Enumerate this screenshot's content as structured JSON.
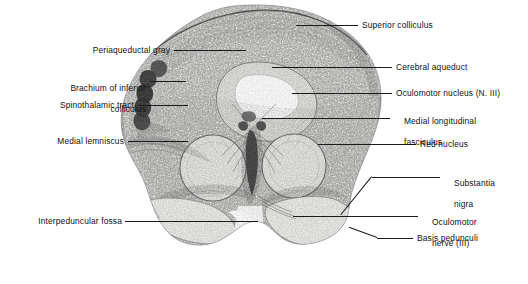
{
  "figure": {
    "background_color": "#ffffff",
    "label_color": "#111111",
    "leader_color": "#1a1a1a",
    "specimen": {
      "stain_description": "Weigert-stained myelin histological section, grayscale",
      "tissue_tone": "#f2f2f0",
      "fiber_tone": "#5a5a5a",
      "dark_tone": "#2b2b2b"
    }
  },
  "labels": {
    "superior_colliculus": {
      "text": "Superior colliculus",
      "side": "right"
    },
    "periaqueductal_gray": {
      "text": "Periaqueductal gray",
      "side": "left"
    },
    "cerebral_aqueduct": {
      "text": "Cerebral aqueduct",
      "side": "right"
    },
    "brachium_of_inferior_colliculus": {
      "line1": "Brachium of inferior",
      "line2": "colliculus",
      "side": "left"
    },
    "oculomotor_nucleus": {
      "text": "Oculomotor nucleus (N. III)",
      "side": "right"
    },
    "spinothalamic_tract": {
      "text": "Spinothalamic tract",
      "side": "left"
    },
    "medial_longitudinal_fasciculus": {
      "line1": "Medial longitudinal",
      "line2": "fasciculus",
      "side": "right"
    },
    "medial_lemniscus": {
      "text": "Medial lemniscus",
      "side": "left"
    },
    "red_nucleus": {
      "text": "Red nucleus",
      "side": "right"
    },
    "substantia_nigra": {
      "line1": "Substantia",
      "line2": "nigra",
      "side": "right"
    },
    "interpeduncular_fossa": {
      "text": "Interpeduncular fossa",
      "side": "left"
    },
    "oculomotor_nerve": {
      "line1": "Oculomotor",
      "line2": "nerve (III)",
      "side": "right"
    },
    "basis_pedunculi": {
      "text": "Basis pedunculi",
      "side": "right"
    }
  }
}
